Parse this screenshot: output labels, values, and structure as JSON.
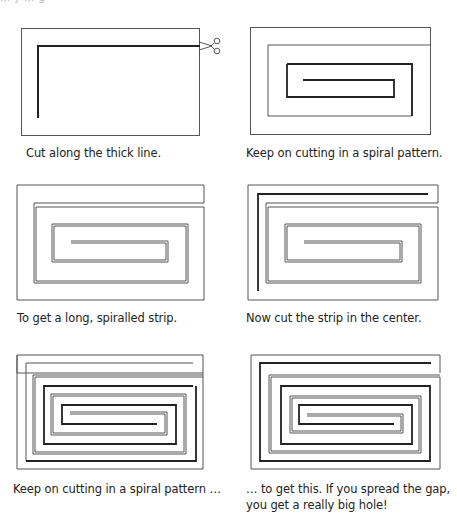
{
  "top_fragment": "... y ... g",
  "panels": [
    {
      "id": 1,
      "caption": "Cut along the thick line."
    },
    {
      "id": 2,
      "caption": "Keep on cutting in a spiral pattern."
    },
    {
      "id": 3,
      "caption": "To get a long, spiralled strip."
    },
    {
      "id": 4,
      "caption": "Now cut the strip in the center."
    },
    {
      "id": 5,
      "caption": "Keep on cutting in a spiral pattern …"
    },
    {
      "id": 6,
      "caption_line1": "… to get this. If you spread the gap,",
      "caption_line2": "you get a really big hole!"
    }
  ],
  "colors": {
    "thin_line": "#555555",
    "thick_line": "#222222",
    "background": "#ffffff"
  }
}
